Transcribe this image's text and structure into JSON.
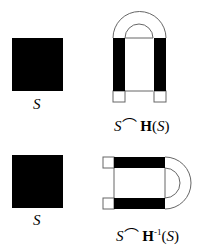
{
  "diagram": {
    "top_row": {
      "set_label": "S",
      "result_label": {
        "left": "S",
        "cap": "⌒",
        "op": "H",
        "exp": "",
        "open": "(",
        "arg": "S",
        "close": ")"
      }
    },
    "bottom_row": {
      "set_label": "S",
      "result_label": {
        "left": "S",
        "cap": "⌒",
        "op": "H",
        "exp": "-1",
        "open": "(",
        "arg": "S",
        "close": ")"
      }
    },
    "colors": {
      "fill": "#000000",
      "stroke": "#555555",
      "background": "#ffffff"
    }
  }
}
